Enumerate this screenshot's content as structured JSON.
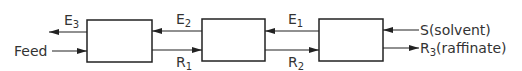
{
  "diagram": {
    "stages": [
      {
        "id": "stage-1"
      },
      {
        "id": "stage-2"
      },
      {
        "id": "stage-3"
      }
    ],
    "labels": {
      "feed": "Feed",
      "e3_main": "E",
      "e3_sub": "3",
      "e2_main": "E",
      "e2_sub": "2",
      "e1_main": "E",
      "e1_sub": "1",
      "r1_main": "R",
      "r1_sub": "1",
      "r2_main": "R",
      "r2_sub": "2",
      "solvent": "S(solvent)",
      "r3_main": "R",
      "r3_sub": "3",
      "r3_suffix": "(raffinate)"
    },
    "colors": {
      "line": "#222222",
      "background": "#ffffff"
    }
  }
}
